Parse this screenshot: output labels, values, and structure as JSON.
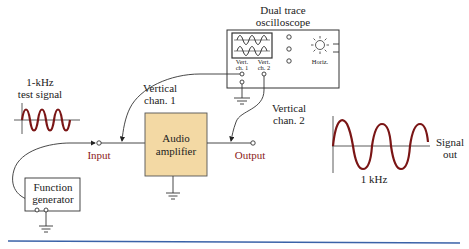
{
  "oscilloscope": {
    "title_line1": "Dual trace",
    "title_line2": "oscilloscope",
    "ch1_line1": "Vert.",
    "ch1_line2": "ch. 1",
    "ch2_line1": "Vert.",
    "ch2_line2": "ch. 2",
    "horiz_label": "Horiz."
  },
  "test_signal": {
    "line1": "1-kHz",
    "line2": "test signal"
  },
  "vertical_chan1": {
    "line1": "Vertical",
    "line2": "chan. 1"
  },
  "vertical_chan2": {
    "line1": "Vertical",
    "line2": "chan. 2"
  },
  "amplifier": {
    "line1": "Audio",
    "line2": "amplifier",
    "fill_color": "#f3d9a4"
  },
  "terminals": {
    "input_label": "Input",
    "output_label": "Output",
    "label_color": "#8b1a1a"
  },
  "function_generator": {
    "line1": "Function",
    "line2": "generator"
  },
  "signal_out": {
    "line1": "Signal",
    "line2": "out",
    "freq_label": "1 kHz"
  },
  "colors": {
    "waveform": "#7a1515",
    "rule": "#3a62a8"
  }
}
